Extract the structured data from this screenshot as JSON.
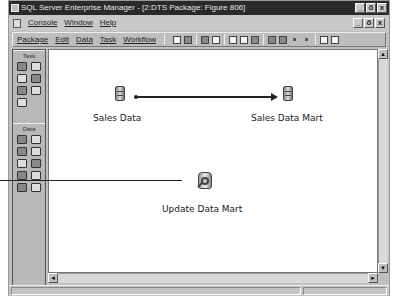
{
  "window": {
    "title": "SQL Server Enterprise Manager - [2:DTS Package: Figure 806]",
    "controls": {
      "minimize": "_",
      "restore": "ő",
      "close": "x"
    }
  },
  "mdi_menu": {
    "items": [
      "Console",
      "Window",
      "Help"
    ]
  },
  "package_menu": {
    "items": [
      "Package",
      "Edit",
      "Data",
      "Task",
      "Workflow"
    ]
  },
  "toolbar": {
    "icons": [
      "new-icon",
      "save-icon",
      "print-icon",
      "open-icon",
      "cut-icon",
      "copy-icon",
      "paste-icon",
      "execute-icon",
      "transform-icon",
      "step-icon",
      "step-icon-2",
      "zoom-icon",
      "find-icon"
    ]
  },
  "palette": {
    "task_title": "Task",
    "data_title": "Data"
  },
  "canvas": {
    "nodes": [
      {
        "label": "Sales Data",
        "icon": "database-icon"
      },
      {
        "label": "Sales Data Mart",
        "icon": "database-icon"
      },
      {
        "label": "Update Data Mart",
        "icon": "data-driven-query-icon"
      }
    ],
    "connections": [
      {
        "from": "Sales Data",
        "to": "Sales Data Mart",
        "type": "transform-data-arrow"
      }
    ]
  },
  "scrollbars": {
    "up": "▲",
    "down": "▼",
    "left": "◄",
    "right": "►"
  }
}
